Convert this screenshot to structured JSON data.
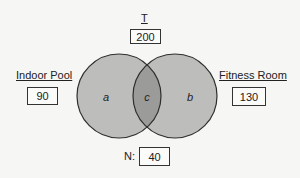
{
  "diagram": {
    "type": "venn",
    "universe": {
      "label": "T",
      "value": "200"
    },
    "sets": [
      {
        "id": "left",
        "label": "Indoor Pool",
        "value": "90"
      },
      {
        "id": "right",
        "label": "Fitness Room",
        "value": "130"
      }
    ],
    "regions": {
      "left_only": "a",
      "intersection": "c",
      "right_only": "b"
    },
    "neither": {
      "label": "N:",
      "value": "40"
    },
    "colors": {
      "background": "#f6f6f4",
      "circle_fill": "#bdbdbc",
      "intersection_fill": "#9b9b9a",
      "stroke": "#2e2e2e"
    }
  }
}
